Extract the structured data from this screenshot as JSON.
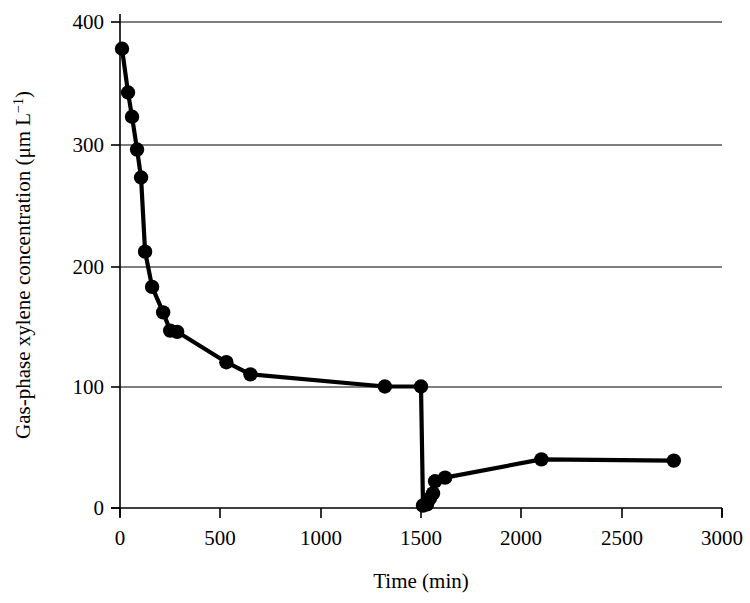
{
  "chart_data": {
    "type": "line",
    "title": "",
    "subtitle": "",
    "xlabel": "Time (min)",
    "ylabel": "Gas-phase xylene concentration (μm L⁻¹)",
    "ylabel_main": "Gas-phase xylene concentration (μm L",
    "ylabel_sup": "−1",
    "ylabel_tail": ")",
    "xlim": [
      0,
      3000
    ],
    "ylim": [
      0,
      400
    ],
    "xticks": [
      0,
      500,
      1000,
      1500,
      2000,
      2500,
      3000
    ],
    "yticks": [
      0,
      100,
      200,
      300,
      400
    ],
    "xtick_labels": [
      "0",
      "500",
      "1000",
      "1500",
      "2000",
      "2500",
      "3000"
    ],
    "ytick_labels": [
      "0",
      "100",
      "200",
      "300",
      "400"
    ],
    "grid": "horizontal",
    "legend": "none",
    "marker": "filled-circle",
    "marker_color": "#000000",
    "line_color": "#000000",
    "series": [
      {
        "name": "Gas-phase xylene concentration",
        "x": [
          10,
          40,
          60,
          85,
          105,
          125,
          160,
          215,
          250,
          285,
          530,
          650,
          1320,
          1500,
          1510,
          1530,
          1545,
          1560,
          1570,
          1620,
          2100,
          2760
        ],
        "y": [
          378,
          342,
          322,
          295,
          272,
          211,
          182,
          161,
          146,
          145,
          120,
          110,
          100,
          100,
          2,
          3,
          8,
          12,
          22,
          25,
          40,
          39
        ]
      }
    ]
  }
}
